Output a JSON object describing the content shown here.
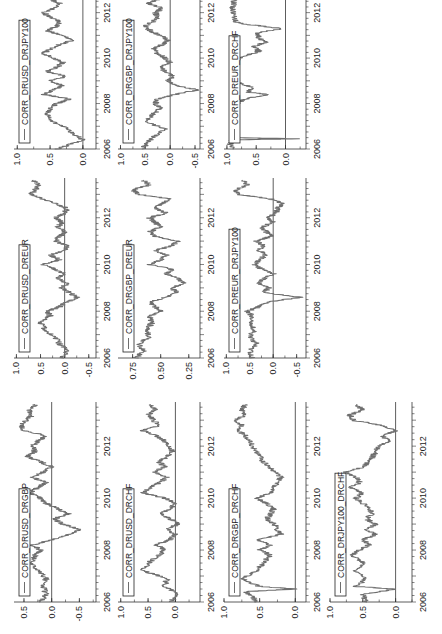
{
  "chart_data": [
    {
      "type": "line",
      "title": "CORR_DRUSD_DRGBP",
      "legend": "CORR_DRUSD_DRGBP",
      "grid_position": {
        "col": 0,
        "row": 0
      },
      "xlim": [
        2006,
        2013.7
      ],
      "xticks": [
        2006,
        2008,
        2010,
        2012
      ],
      "ylim": [
        -0.8,
        0.68
      ],
      "yticks": [
        0.5,
        0.0,
        -0.5
      ],
      "ytick_labels": [
        "0.5",
        "0.0",
        "-0.5"
      ],
      "zero_line": true,
      "x": [
        2006.0,
        2006.3,
        2006.6,
        2006.9,
        2007.2,
        2007.5,
        2007.8,
        2008.0,
        2008.2,
        2008.4,
        2008.6,
        2008.8,
        2009.0,
        2009.2,
        2009.4,
        2009.6,
        2009.8,
        2010.0,
        2010.2,
        2010.4,
        2010.6,
        2010.8,
        2011.0,
        2011.2,
        2011.4,
        2011.6,
        2011.8,
        2012.0,
        2012.2,
        2012.4,
        2012.6,
        2012.8,
        2013.0,
        2013.2,
        2013.4,
        2013.6
      ],
      "values": [
        0.2,
        0.1,
        0.15,
        0.1,
        0.25,
        0.35,
        0.3,
        0.2,
        0.35,
        0.0,
        -0.3,
        -0.5,
        -0.2,
        -0.05,
        -0.3,
        -0.1,
        0.1,
        0.2,
        0.4,
        0.25,
        0.1,
        0.35,
        0.15,
        0.0,
        0.2,
        0.45,
        0.3,
        0.35,
        0.25,
        0.1,
        0.5,
        0.55,
        0.45,
        0.35,
        0.4,
        0.3
      ]
    },
    {
      "type": "line",
      "title": "CORR_DRUSD_DRCHF",
      "legend": "CORR_DRUSD_DRCHF",
      "grid_position": {
        "col": 0,
        "row": 1
      },
      "xlim": [
        2006,
        2013.7
      ],
      "xticks": [
        2006,
        2008,
        2010,
        2012
      ],
      "ylim": [
        -0.45,
        1.05
      ],
      "yticks": [
        1.0,
        0.5,
        0.0
      ],
      "ytick_labels": [
        "1.0",
        "0.5",
        "0.0"
      ],
      "zero_line": true,
      "x": [
        2006.0,
        2006.3,
        2006.6,
        2006.9,
        2007.2,
        2007.5,
        2007.8,
        2008.0,
        2008.2,
        2008.4,
        2008.6,
        2008.8,
        2009.0,
        2009.2,
        2009.4,
        2009.6,
        2009.8,
        2010.0,
        2010.2,
        2010.4,
        2010.6,
        2010.8,
        2011.0,
        2011.2,
        2011.4,
        2011.6,
        2011.8,
        2012.0,
        2012.2,
        2012.4,
        2012.6,
        2012.8,
        2013.0,
        2013.2,
        2013.4,
        2013.6
      ],
      "values": [
        0.1,
        -0.05,
        0.2,
        0.15,
        0.6,
        0.5,
        0.3,
        0.2,
        0.35,
        0.1,
        0.0,
        0.15,
        -0.05,
        0.1,
        0.25,
        0.1,
        0.0,
        0.2,
        0.6,
        0.45,
        0.3,
        0.15,
        0.4,
        0.2,
        0.3,
        0.15,
        0.05,
        0.1,
        0.2,
        0.35,
        0.6,
        0.3,
        0.4,
        0.5,
        0.35,
        0.45
      ]
    },
    {
      "type": "line",
      "title": "CORR_DRGBP_DRCHF",
      "legend": "CORR_DRGBP_DRCHF",
      "grid_position": {
        "col": 0,
        "row": 2
      },
      "xlim": [
        2006,
        2013.7
      ],
      "xticks": [
        2006,
        2008,
        2010,
        2012
      ],
      "ylim": [
        -0.15,
        1.0
      ],
      "yticks": [
        1.0,
        0.5,
        0.0
      ],
      "ytick_labels": [
        "1.0",
        "0.5",
        "0.0"
      ],
      "zero_line": true,
      "x": [
        2006.0,
        2006.2,
        2006.4,
        2006.5,
        2006.6,
        2006.9,
        2007.2,
        2007.5,
        2007.8,
        2008.0,
        2008.2,
        2008.4,
        2008.6,
        2008.8,
        2009.0,
        2009.2,
        2009.4,
        2009.6,
        2009.8,
        2010.0,
        2010.2,
        2010.4,
        2010.6,
        2010.8,
        2011.0,
        2011.2,
        2011.4,
        2011.6,
        2011.8,
        2012.0,
        2012.2,
        2012.4,
        2012.6,
        2012.8,
        2013.0,
        2013.2,
        2013.4,
        2013.6
      ],
      "values": [
        0.55,
        0.6,
        0.7,
        0.0,
        0.5,
        0.75,
        0.55,
        0.45,
        0.35,
        0.5,
        0.35,
        0.55,
        0.2,
        0.25,
        0.3,
        0.4,
        0.35,
        0.3,
        0.4,
        0.55,
        0.35,
        0.3,
        0.25,
        0.2,
        0.3,
        0.35,
        0.45,
        0.5,
        0.55,
        0.6,
        0.65,
        0.7,
        0.8,
        0.75,
        0.85,
        0.7,
        0.75,
        0.7
      ]
    },
    {
      "type": "line",
      "title": "CORR_DRJPY100_DRCHF",
      "legend": "CORR_DRJPY100_DRCHF",
      "grid_position": {
        "col": 0,
        "row": 3
      },
      "xlim": [
        2006,
        2013.7
      ],
      "xticks": [
        2006,
        2008,
        2010,
        2012
      ],
      "ylim": [
        -0.25,
        1.0
      ],
      "yticks": [
        1.0,
        0.5,
        0.0
      ],
      "ytick_labels": [
        "1.0",
        "0.5",
        "0.0"
      ],
      "zero_line": true,
      "x": [
        2006.0,
        2006.3,
        2006.5,
        2006.6,
        2006.9,
        2007.2,
        2007.5,
        2007.8,
        2008.0,
        2008.2,
        2008.4,
        2008.6,
        2008.8,
        2009.0,
        2009.2,
        2009.4,
        2009.6,
        2009.8,
        2010.0,
        2010.2,
        2010.4,
        2010.6,
        2010.8,
        2011.0,
        2011.2,
        2011.4,
        2011.6,
        2011.8,
        2012.0,
        2012.2,
        2012.4,
        2012.6,
        2012.8,
        2013.0,
        2013.2,
        2013.4,
        2013.6
      ],
      "values": [
        0.45,
        0.5,
        0.0,
        0.6,
        0.45,
        0.6,
        0.5,
        0.65,
        0.55,
        0.4,
        0.5,
        0.3,
        0.45,
        0.3,
        0.45,
        0.35,
        0.4,
        0.5,
        0.6,
        0.5,
        0.7,
        0.55,
        0.6,
        0.75,
        0.5,
        0.4,
        0.35,
        0.3,
        0.25,
        0.1,
        0.2,
        0.0,
        0.2,
        0.65,
        0.7,
        0.5,
        0.6
      ]
    },
    {
      "type": "line",
      "title": "CORR_DRUSD_DREUR",
      "legend": "CORR_DRUSD_DREUR",
      "grid_position": {
        "col": 1,
        "row": 0
      },
      "xlim": [
        2006,
        2013.7
      ],
      "xticks": [
        2006,
        2008,
        2010,
        2012
      ],
      "ylim": [
        -0.65,
        1.05
      ],
      "yticks": [
        1.0,
        0.5,
        0.0,
        -0.5
      ],
      "ytick_labels": [
        "1.0",
        "0.5",
        "0.0",
        "-0.5"
      ],
      "zero_line": true,
      "x": [
        2006.0,
        2006.3,
        2006.6,
        2006.9,
        2007.2,
        2007.5,
        2007.8,
        2008.0,
        2008.2,
        2008.4,
        2008.6,
        2008.8,
        2009.0,
        2009.2,
        2009.4,
        2009.6,
        2009.8,
        2010.0,
        2010.2,
        2010.4,
        2010.6,
        2010.8,
        2011.0,
        2011.2,
        2011.4,
        2011.6,
        2011.8,
        2012.0,
        2012.2,
        2012.4,
        2012.6,
        2012.8,
        2013.0,
        2013.2,
        2013.4,
        2013.6
      ],
      "values": [
        0.05,
        -0.05,
        0.1,
        0.2,
        0.4,
        0.5,
        0.3,
        0.35,
        0.1,
        -0.05,
        -0.25,
        -0.1,
        0.05,
        -0.05,
        0.15,
        0.0,
        0.2,
        0.45,
        0.1,
        0.3,
        0.0,
        -0.05,
        0.2,
        0.1,
        0.0,
        0.15,
        0.05,
        0.2,
        0.0,
        -0.05,
        0.15,
        0.45,
        0.7,
        0.6,
        0.55,
        0.65
      ]
    },
    {
      "type": "line",
      "title": "CORR_DRGBP_DREUR",
      "legend": "CORR_DRGBP_DREUR",
      "grid_position": {
        "col": 1,
        "row": 1
      },
      "xlim": [
        2006,
        2013.7
      ],
      "xticks": [
        2006,
        2008,
        2010,
        2012
      ],
      "ylim": [
        0.15,
        0.88
      ],
      "yticks": [
        0.75,
        0.5,
        0.25
      ],
      "ytick_labels": [
        "0.75",
        "0.50",
        "0.25"
      ],
      "zero_line": false,
      "x": [
        2006.0,
        2006.3,
        2006.6,
        2006.9,
        2007.2,
        2007.5,
        2007.8,
        2008.0,
        2008.2,
        2008.4,
        2008.6,
        2008.8,
        2009.0,
        2009.2,
        2009.4,
        2009.6,
        2009.8,
        2010.0,
        2010.2,
        2010.4,
        2010.6,
        2010.8,
        2011.0,
        2011.2,
        2011.4,
        2011.6,
        2011.8,
        2012.0,
        2012.2,
        2012.4,
        2012.6,
        2012.8,
        2013.0,
        2013.2,
        2013.4,
        2013.6
      ],
      "values": [
        0.72,
        0.65,
        0.7,
        0.6,
        0.62,
        0.58,
        0.6,
        0.5,
        0.55,
        0.6,
        0.45,
        0.35,
        0.4,
        0.3,
        0.35,
        0.45,
        0.4,
        0.6,
        0.5,
        0.45,
        0.55,
        0.4,
        0.35,
        0.55,
        0.6,
        0.5,
        0.55,
        0.6,
        0.45,
        0.55,
        0.5,
        0.4,
        0.7,
        0.75,
        0.6,
        0.65
      ]
    },
    {
      "type": "line",
      "title": "CORR_DREUR_DRJPY100",
      "legend": "CORR_DREUR_DRJPY100",
      "grid_position": {
        "col": 1,
        "row": 2
      },
      "xlim": [
        2006,
        2013.7
      ],
      "xticks": [
        2006,
        2008,
        2010,
        2012
      ],
      "ylim": [
        -0.7,
        1.05
      ],
      "yticks": [
        1.0,
        0.5,
        0.0,
        -0.5
      ],
      "ytick_labels": [
        "1.0",
        "0.5",
        "0.0",
        "-0.5"
      ],
      "zero_line": true,
      "x": [
        2006.0,
        2006.3,
        2006.6,
        2006.9,
        2007.2,
        2007.5,
        2007.8,
        2008.0,
        2008.2,
        2008.4,
        2008.6,
        2008.8,
        2009.0,
        2009.2,
        2009.4,
        2009.6,
        2009.8,
        2010.0,
        2010.2,
        2010.4,
        2010.6,
        2010.8,
        2011.0,
        2011.2,
        2011.4,
        2011.6,
        2011.8,
        2012.0,
        2012.2,
        2012.4,
        2012.6,
        2012.8,
        2013.0,
        2013.2,
        2013.4,
        2013.6
      ],
      "values": [
        0.45,
        0.5,
        0.35,
        0.5,
        0.4,
        0.5,
        0.45,
        0.55,
        0.3,
        0.1,
        -0.6,
        0.2,
        0.1,
        0.3,
        0.2,
        0.0,
        0.25,
        0.4,
        0.3,
        0.15,
        0.3,
        0.2,
        0.35,
        0.05,
        0.15,
        0.25,
        0.0,
        0.1,
        -0.05,
        -0.1,
        -0.2,
        0.05,
        0.75,
        0.8,
        0.55,
        0.65
      ]
    },
    {
      "type": "line",
      "title": "CORR_DRUSD_DRJPY100",
      "legend": "CORR_DRUSD_DRJPY100",
      "grid_position": {
        "col": 2,
        "row": 0
      },
      "xlim": [
        2006,
        2013.7
      ],
      "xticks": [
        2006,
        2008,
        2010,
        2012
      ],
      "ylim": [
        -0.2,
        1.05
      ],
      "yticks": [
        1.0,
        0.5,
        0.0
      ],
      "ytick_labels": [
        "1.0",
        "0.5",
        "0.0"
      ],
      "zero_line": true,
      "x": [
        2006.0,
        2006.2,
        2006.4,
        2006.6,
        2006.9,
        2007.2,
        2007.5,
        2007.8,
        2008.0,
        2008.2,
        2008.4,
        2008.6,
        2008.8,
        2009.0,
        2009.2,
        2009.4,
        2009.6,
        2009.8,
        2010.0,
        2010.2,
        2010.4,
        2010.6,
        2010.8,
        2011.0,
        2011.2,
        2011.4,
        2011.6,
        2011.8,
        2012.0,
        2012.2,
        2012.4,
        2012.6,
        2012.8,
        2013.0,
        2013.2,
        2013.4,
        2013.6
      ],
      "values": [
        0.4,
        0.2,
        0.0,
        0.1,
        0.25,
        0.45,
        0.55,
        0.5,
        0.4,
        0.2,
        0.6,
        0.45,
        0.3,
        0.5,
        0.25,
        0.55,
        0.4,
        0.3,
        0.45,
        0.6,
        0.5,
        0.35,
        0.15,
        0.3,
        0.55,
        0.4,
        0.35,
        0.5,
        0.6,
        0.45,
        0.35,
        0.5,
        0.7,
        0.0,
        0.75,
        0.45,
        0.55
      ]
    },
    {
      "type": "line",
      "title": "CORR_DRGBP_DRJPY100",
      "legend": "CORR_DRGBP_DRJPY100",
      "grid_position": {
        "col": 2,
        "row": 1
      },
      "xlim": [
        2006,
        2013.7
      ],
      "xticks": [
        2006,
        2008,
        2010,
        2012
      ],
      "ylim": [
        -0.6,
        1.05
      ],
      "yticks": [
        1.0,
        0.5,
        0.0,
        -0.5
      ],
      "ytick_labels": [
        "1.0",
        "0.5",
        "0.0",
        "-0.5"
      ],
      "zero_line": true,
      "x": [
        2006.0,
        2006.3,
        2006.6,
        2006.9,
        2007.2,
        2007.5,
        2007.8,
        2008.0,
        2008.2,
        2008.4,
        2008.6,
        2008.8,
        2009.0,
        2009.2,
        2009.4,
        2009.6,
        2009.8,
        2010.0,
        2010.2,
        2010.4,
        2010.6,
        2010.8,
        2011.0,
        2011.2,
        2011.4,
        2011.6,
        2011.8,
        2012.0,
        2012.2,
        2012.4,
        2012.6,
        2012.8,
        2013.0,
        2013.2,
        2013.4,
        2013.6
      ],
      "values": [
        0.55,
        0.45,
        0.3,
        0.1,
        0.5,
        0.35,
        0.2,
        0.3,
        0.25,
        -0.1,
        -0.55,
        -0.1,
        0.05,
        -0.05,
        0.1,
        0.2,
        0.0,
        0.1,
        0.25,
        0.35,
        0.15,
        0.05,
        0.2,
        0.4,
        0.5,
        0.35,
        0.25,
        0.3,
        0.15,
        0.45,
        0.2,
        0.5,
        0.75,
        0.6,
        0.55,
        0.35
      ]
    },
    {
      "type": "line",
      "title": "CORR_DREUR_DRCHF",
      "legend": "CORR_DREUR_DRCHF",
      "grid_position": {
        "col": 2,
        "row": 2
      },
      "xlim": [
        2006,
        2013.7
      ],
      "xticks": [
        2006,
        2008,
        2010,
        2012
      ],
      "ylim": [
        -0.35,
        1.05
      ],
      "yticks": [
        1.0,
        0.5,
        0.0
      ],
      "ytick_labels": [
        "1.0",
        "0.5",
        "0.0"
      ],
      "zero_line": true,
      "x": [
        2006.0,
        2006.2,
        2006.4,
        2006.45,
        2006.5,
        2006.8,
        2007.1,
        2007.4,
        2007.7,
        2008.0,
        2008.2,
        2008.4,
        2008.5,
        2008.7,
        2008.9,
        2009.2,
        2009.5,
        2009.8,
        2010.1,
        2010.3,
        2010.5,
        2010.7,
        2010.9,
        2011.1,
        2011.3,
        2011.5,
        2011.6,
        2011.8,
        2012.2,
        2012.5,
        2012.8,
        2012.9,
        2013.1,
        2013.4,
        2013.6
      ],
      "values": [
        0.9,
        0.95,
        0.92,
        -0.2,
        0.9,
        0.88,
        0.9,
        0.85,
        0.88,
        0.8,
        0.7,
        0.3,
        0.65,
        0.55,
        0.8,
        0.85,
        0.82,
        0.85,
        0.7,
        0.45,
        0.55,
        0.35,
        0.45,
        0.5,
        0.05,
        0.7,
        0.85,
        0.88,
        0.9,
        0.88,
        0.65,
        0.8,
        0.85,
        0.9,
        0.9
      ]
    }
  ],
  "figure": {
    "rotation_deg": -90,
    "line_color": "#6e6e6e",
    "axis_color": "#333333"
  }
}
